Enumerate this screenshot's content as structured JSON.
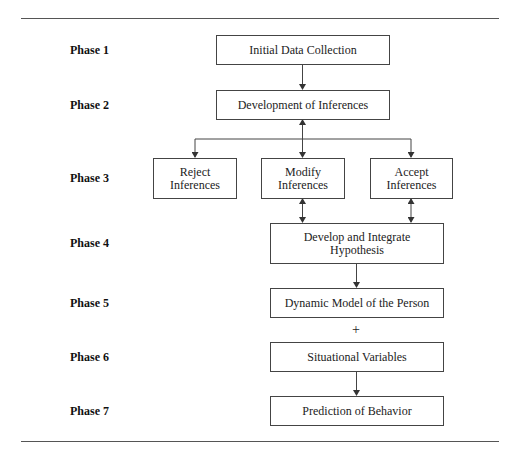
{
  "phases": [
    {
      "label": "Phase 1"
    },
    {
      "label": "Phase 2"
    },
    {
      "label": "Phase 3"
    },
    {
      "label": "Phase 4"
    },
    {
      "label": "Phase 5"
    },
    {
      "label": "Phase 6"
    },
    {
      "label": "Phase 7"
    }
  ],
  "nodes": {
    "initial_data": {
      "label": "Initial Data Collection"
    },
    "development": {
      "label": "Development of Inferences"
    },
    "reject": {
      "line1": "Reject",
      "line2": "Inferences"
    },
    "modify": {
      "line1": "Modify",
      "line2": "Inferences"
    },
    "accept": {
      "line1": "Accept",
      "line2": "Inferences"
    },
    "develop_integrate": {
      "line1": "Develop and Integrate",
      "line2": "Hypothesis"
    },
    "dynamic_model": {
      "label": "Dynamic Model of the Person"
    },
    "situational": {
      "label": "Situational Variables"
    },
    "prediction": {
      "label": "Prediction of Behavior"
    }
  },
  "combine_symbol": "+",
  "colors": {
    "line": "#444444",
    "text": "#222222",
    "rule": "#555555"
  }
}
